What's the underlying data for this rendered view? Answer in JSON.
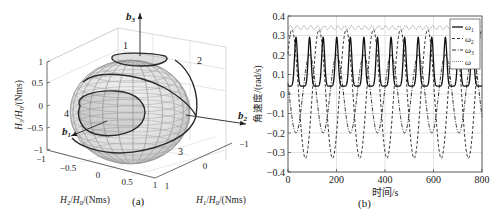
{
  "panel_a": {
    "caption": "(a)",
    "axes": {
      "z_label": "H3/H0/(Nms)",
      "x_label": "H2/H0/(Nms)",
      "y_label": "H1/H0/(Nms)",
      "z_ticks": [
        "1",
        "0.5",
        "0",
        "−0.5",
        "−1"
      ],
      "x_ticks": [
        "−1",
        "−0.5",
        "0",
        "0.5",
        "1"
      ],
      "y_ticks": [
        "1",
        "0",
        "−1"
      ]
    },
    "body_axes": [
      "b1",
      "b2",
      "b3"
    ],
    "curve_labels": [
      "1",
      "2",
      "3",
      "4"
    ]
  },
  "panel_b": {
    "caption": "(b)",
    "xlabel": "时间/s",
    "ylabel": "角速度/(rad/s)",
    "legend": [
      "ω1",
      "ω2",
      "ω3",
      "ω"
    ]
  },
  "chart_data": [
    {
      "type": "surface3d",
      "title": "",
      "description": "Angular momentum ellipsoid with polhode trajectories (curves 1-4) and body axes b1, b2, b3",
      "xlabel": "H2/H0/(Nms)",
      "ylabel": "H1/H0/(Nms)",
      "zlabel": "H3/H0/(Nms)",
      "xlim": [
        -1,
        1
      ],
      "ylim": [
        -1,
        1
      ],
      "zlim": [
        -1,
        1
      ],
      "x_ticks": [
        -1,
        -0.5,
        0,
        0.5,
        1
      ],
      "y_ticks": [
        -1,
        0,
        1
      ],
      "z_ticks": [
        -1,
        -0.5,
        0,
        0.5,
        1
      ],
      "curves": [
        "1",
        "2",
        "3",
        "4"
      ],
      "grid": true
    },
    {
      "type": "line",
      "title": "",
      "xlabel": "时间/s",
      "ylabel": "角速度/(rad/s)",
      "xlim": [
        0,
        800
      ],
      "ylim": [
        -0.4,
        0.4
      ],
      "x_ticks": [
        0,
        200,
        400,
        600,
        800
      ],
      "y_ticks": [
        -0.4,
        -0.3,
        -0.2,
        -0.1,
        0,
        0.1,
        0.2,
        0.3,
        0.4
      ],
      "grid": true,
      "legend_position": "upper right",
      "series": [
        {
          "name": "ω1",
          "style": "solid",
          "min": 0.04,
          "max": 0.29,
          "period_s": 56,
          "description": "periodic narrow peaks ~0.29 rad/s, baseline ~0.04"
        },
        {
          "name": "ω2",
          "style": "dashed",
          "min": -0.33,
          "max": 0.33,
          "period_s": 112,
          "description": "oscillates between ≈−0.33 and ≈0.33 rad/s"
        },
        {
          "name": "ω3",
          "style": "dash-dot",
          "min": -0.2,
          "max": 0.2,
          "period_s": 112,
          "description": "oscillates between ≈−0.20 and ≈0.20 rad/s"
        },
        {
          "name": "ω",
          "style": "dotted",
          "min": 0.33,
          "max": 0.35,
          "period_s": 56,
          "description": "nearly constant magnitude ≈0.34 rad/s with small ripples"
        }
      ]
    }
  ]
}
